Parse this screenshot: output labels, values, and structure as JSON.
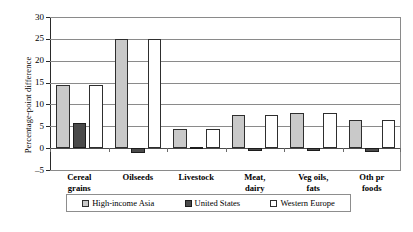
{
  "chart_data": {
    "type": "bar",
    "title": "",
    "xlabel": "",
    "ylabel": "Percentage-point difference",
    "ylim": [
      -5,
      30
    ],
    "ytick_step": 5,
    "yticks": [
      30,
      25,
      20,
      15,
      10,
      5,
      0,
      -5
    ],
    "ytick_labels": [
      "30",
      "25",
      "20",
      "15",
      "10",
      "5",
      "0",
      "–5"
    ],
    "grid": true,
    "legend_position": "bottom",
    "categories": [
      {
        "line1": "Cereal",
        "line2": "grains"
      },
      {
        "line1": "Oilseeds",
        "line2": ""
      },
      {
        "line1": "Livestock",
        "line2": ""
      },
      {
        "line1": "Meat,",
        "line2": "dairy"
      },
      {
        "line1": "Veg oils,",
        "line2": "fats"
      },
      {
        "line1": "Oth pr",
        "line2": "foods"
      }
    ],
    "category_labels": [
      "Cereal grains",
      "Oilseeds",
      "Livestock",
      "Meat, dairy",
      "Veg oils, fats",
      "Oth pr foods"
    ],
    "series": [
      {
        "name": "High-income Asia",
        "color": "#c9c9c9",
        "values": [
          14.5,
          25.0,
          4.3,
          7.5,
          8.0,
          6.5
        ]
      },
      {
        "name": "United States",
        "color": "#4a4a4a",
        "values": [
          5.8,
          -1.0,
          0.3,
          -0.7,
          -0.7,
          -0.8
        ]
      },
      {
        "name": "Western Europe",
        "color": "#ffffff",
        "values": [
          14.5,
          25.0,
          4.3,
          7.5,
          8.0,
          6.5
        ]
      }
    ]
  },
  "legend": {
    "items": [
      {
        "label": "High-income Asia",
        "swatch": "hia"
      },
      {
        "label": "United States",
        "swatch": "us"
      },
      {
        "label": "Western Europe",
        "swatch": "we"
      }
    ]
  },
  "bottom_artifact": {
    "text": ""
  }
}
